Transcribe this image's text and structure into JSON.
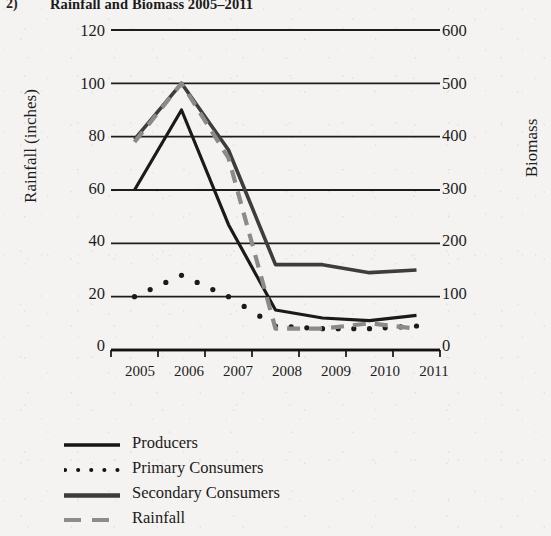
{
  "title": {
    "enumerator": "2)",
    "text": "Rainfall and Biomass 2005–2011"
  },
  "axes": {
    "left_label": "Rainfall (inches)",
    "right_label": "Biomass",
    "left_ticks": [
      "0",
      "20",
      "40",
      "60",
      "80",
      "100",
      "120"
    ],
    "right_ticks": [
      "0",
      "100",
      "200",
      "300",
      "400",
      "500",
      "600"
    ],
    "x_ticks": [
      "2005",
      "2006",
      "2007",
      "2008",
      "2009",
      "2010",
      "2011"
    ]
  },
  "legend": {
    "items": [
      {
        "label": "Producers",
        "style": "solid-black",
        "color": "#1a1a1a"
      },
      {
        "label": "Primary Consumers",
        "style": "dotted-black",
        "color": "#1a1a1a"
      },
      {
        "label": "Secondary Consumers",
        "style": "solid-dark-gray",
        "color": "#3d3d3d"
      },
      {
        "label": "Rainfall",
        "style": "dashed-gray",
        "color": "#8a8a8a"
      }
    ]
  },
  "chart_data": {
    "type": "line",
    "title": "Rainfall and Biomass 2005–2011",
    "xlabel": "",
    "ylabel": "Rainfall (inches)",
    "y2label": "Biomass",
    "categories": [
      "2005",
      "2006",
      "2007",
      "2008",
      "2009",
      "2010",
      "2011"
    ],
    "ylim": [
      0,
      120
    ],
    "y2lim": [
      0,
      600
    ],
    "grid": true,
    "legend_position": "bottom-left",
    "series": [
      {
        "name": "Producers",
        "axis": "left",
        "style": "solid",
        "color": "#1a1a1a",
        "values": [
          60,
          90,
          47,
          15,
          12,
          11,
          13
        ]
      },
      {
        "name": "Primary Consumers",
        "axis": "left",
        "style": "dotted",
        "color": "#1a1a1a",
        "values": [
          20,
          28,
          20,
          9,
          8,
          8,
          9
        ]
      },
      {
        "name": "Secondary Consumers",
        "axis": "left",
        "style": "solid",
        "color": "#3d3d3d",
        "values": [
          79,
          100,
          75,
          32,
          32,
          29,
          30
        ]
      },
      {
        "name": "Rainfall",
        "axis": "left",
        "style": "dashed",
        "color": "#8a8a8a",
        "values": [
          78,
          100,
          72,
          8,
          8,
          10,
          8
        ]
      }
    ]
  }
}
